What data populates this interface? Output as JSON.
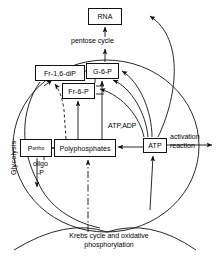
{
  "figure": {
    "type": "metabolic-pathway-diagram",
    "title_visible": false,
    "background": "#ffffff",
    "stroke": "#111111"
  },
  "nodes": [
    {
      "id": "rna",
      "label": "RNA",
      "x": 88,
      "y": 8,
      "w": 34,
      "h": 17
    },
    {
      "id": "fr16dip",
      "label": "Fr-1,6-diP",
      "x": 35,
      "y": 65,
      "w": 50,
      "h": 16
    },
    {
      "id": "g6p",
      "label": "G-6-P",
      "x": 86,
      "y": 63,
      "w": 33,
      "h": 16
    },
    {
      "id": "fr6p",
      "label": "Fr-6-P",
      "x": 62,
      "y": 83,
      "w": 33,
      "h": 16
    },
    {
      "id": "polyphosphates",
      "label": "Polyphosphates",
      "x": 54,
      "y": 139,
      "w": 62,
      "h": 18
    },
    {
      "id": "atp",
      "label": "ATP",
      "x": 143,
      "y": 138,
      "w": 24,
      "h": 15
    }
  ],
  "subscript_nodes": [
    {
      "id": "portho",
      "base": "P",
      "sub": "ortho",
      "x": 20,
      "y": 139,
      "w": 32,
      "h": 18
    }
  ],
  "labels": [
    {
      "id": "pentose-cycle",
      "text": "pentose cycle",
      "x": 71,
      "y": 41
    },
    {
      "id": "atp-adp",
      "text": "ATP,ADP",
      "x": 108,
      "y": 122
    },
    {
      "id": "activation-reaction",
      "text": "activation\nreaction",
      "x": 170,
      "y": 133
    },
    {
      "id": "oligo-p",
      "text": "oligo\n-P",
      "x": 35,
      "y": 160
    },
    {
      "id": "krebs",
      "text": "Krebs cycle and oxidative\nphosphorylation",
      "x": 109,
      "y": 232
    }
  ],
  "vertical_labels": [
    {
      "id": "glycolysis",
      "text": "Glycolysis",
      "x": 10,
      "y": 175
    }
  ],
  "arrows": [
    {
      "id": "pentose-to-rna",
      "from": "pentose cycle label",
      "to": "RNA",
      "style": "solid-straight"
    },
    {
      "id": "g6p-to-pentose",
      "from": "G-6-P",
      "to": "pentose cycle",
      "style": "solid-straight"
    },
    {
      "id": "fr16dip-to-g6p",
      "from": "Fr-1,6-diP",
      "to": "G-6-P",
      "style": "solid"
    },
    {
      "id": "polyp-to-fr6p",
      "from": "Polyphosphates",
      "to": "Fr-6-P",
      "style": "solid-straight"
    },
    {
      "id": "polyp-to-g6p",
      "from": "Polyphosphates",
      "to": "G-6-P",
      "style": "solid-straight"
    },
    {
      "id": "polyp-to-fr16dip",
      "from": "Polyphosphates",
      "to": "Fr-1,6-diP",
      "style": "dashed"
    },
    {
      "id": "polyp-to-portho",
      "from": "Polyphosphates",
      "to": "P-ortho",
      "style": "solid-straight"
    },
    {
      "id": "atp-to-polyp",
      "from": "ATP",
      "to": "Polyphosphates",
      "style": "solid-straight"
    },
    {
      "id": "atp-to-activation",
      "from": "ATP",
      "to": "activation reaction",
      "style": "solid-straight"
    },
    {
      "id": "atp-to-rna",
      "from": "ATP",
      "to": "RNA",
      "style": "curved"
    },
    {
      "id": "atp-to-g6p-a",
      "from": "ATP",
      "to": "G-6-P",
      "style": "curved"
    },
    {
      "id": "atp-to-g6p-b",
      "from": "ATP",
      "to": "G-6-P",
      "style": "curved"
    },
    {
      "id": "atp-to-fr6p",
      "from": "ATP",
      "to": "Fr-6-P",
      "style": "curved"
    },
    {
      "id": "krebs-to-atp",
      "from": "Krebs cycle",
      "to": "ATP",
      "style": "solid-straight"
    },
    {
      "id": "krebs-to-polyp",
      "from": "Krebs cycle",
      "to": "Polyphosphates",
      "style": "dash-dot"
    },
    {
      "id": "fr16dip-glycolysis-down",
      "from": "Fr-1,6-diP",
      "to": "Glycolysis",
      "style": "curved"
    },
    {
      "id": "portho-down",
      "from": "P-ortho",
      "to": "Glycolysis loop",
      "style": "solid-straight"
    }
  ]
}
